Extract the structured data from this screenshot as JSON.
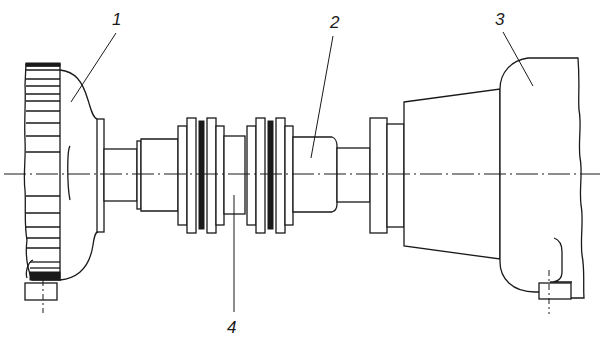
{
  "figure": {
    "colors": {
      "line": "#1a1a1a",
      "background": "#ffffff"
    }
  },
  "callouts": [
    {
      "id": "1",
      "label": "1",
      "component": "drive unit (left machine housing)"
    },
    {
      "id": "2",
      "label": "2",
      "component": "shaft"
    },
    {
      "id": "3",
      "label": "3",
      "component": "driven unit (right machine housing)"
    },
    {
      "id": "4",
      "label": "4",
      "component": "double flexible coupling"
    }
  ]
}
